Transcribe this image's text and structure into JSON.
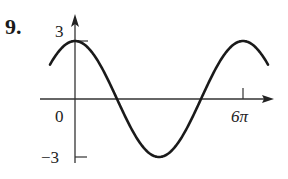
{
  "problem": {
    "number": "9."
  },
  "chart_data": {
    "type": "line",
    "title": "",
    "function_description": "y = 3 cos(x/3), one full period over [0, 6π]",
    "xlabel": "",
    "ylabel": "",
    "x_tick_labels": [
      "0",
      "6π"
    ],
    "y_tick_labels": [
      "3",
      "-3"
    ],
    "xlim": [
      -1.4,
      7.1
    ],
    "ylim": [
      -3,
      3
    ],
    "amplitude": 3,
    "period": "6π",
    "x": [
      "0",
      "1.5π",
      "3π",
      "4.5π",
      "6π"
    ],
    "values": [
      3,
      0,
      -3,
      0,
      3
    ],
    "grid": false,
    "legend": null
  },
  "labels": {
    "y_max": "3",
    "y_min": "−3",
    "origin": "0",
    "x_end": "6π"
  },
  "colors": {
    "curve": "#1a1a1a",
    "axis": "#333333"
  }
}
